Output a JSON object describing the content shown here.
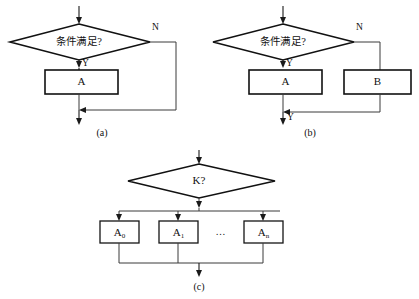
{
  "figure": {
    "background_color": "#ffffff",
    "line_color": "#3a3a3a",
    "shape_stroke_color": "#111111",
    "shape_fill_color": "#ffffff",
    "text_color": "#111111"
  },
  "diagram_a": {
    "caption": "(a)",
    "decision_label": "条件满足?",
    "branch_true_label": "Y",
    "branch_false_label": "N",
    "process_label": "A"
  },
  "diagram_b": {
    "caption": "(b)",
    "decision_label": "条件满足?",
    "branch_true_label": "Y",
    "branch_false_label": "N",
    "process_left_label": "A",
    "process_right_label": "B",
    "merge_label": "Y"
  },
  "diagram_c": {
    "caption": "(c)",
    "decision_label": "K?",
    "ellipsis": "…",
    "branches": [
      {
        "base": "A",
        "subscript": "0"
      },
      {
        "base": "A",
        "subscript": "1"
      },
      {
        "base": "A",
        "subscript": "n"
      }
    ]
  }
}
